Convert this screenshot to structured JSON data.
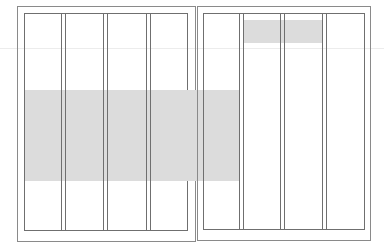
{
  "diagram": {
    "type": "two-page spread column grid layout",
    "colors": {
      "background": "#ffffff",
      "lines": "#6f6f6f",
      "page_border": "#8a8a8a",
      "highlight": "#dcdcdc",
      "guide": "#ececec"
    },
    "left_page": {
      "columns": 4,
      "highlight_band": {
        "description": "horizontal gray block spanning all left-page columns and first right-page column",
        "y": [
          90,
          181
        ]
      }
    },
    "right_page": {
      "columns": 4,
      "highlight_block": {
        "description": "gray block across columns 2-3 near top",
        "y": [
          20,
          43
        ]
      }
    },
    "guide_line_y": 48
  }
}
